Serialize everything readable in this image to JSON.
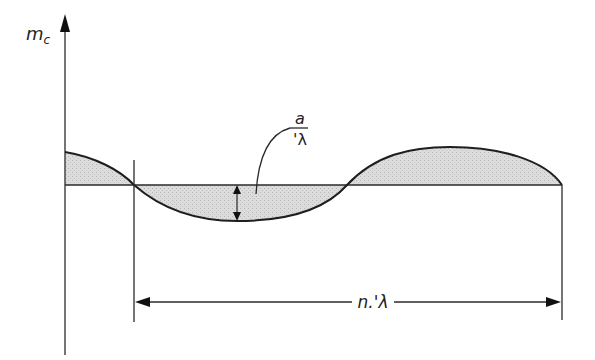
{
  "diagram": {
    "y_axis_label": "m",
    "y_axis_label_sub": "c",
    "amplitude_label_numerator": "a",
    "amplitude_label_denominator": "'λ",
    "wavelength_label": "n.'λ",
    "colors": {
      "line": "#2a2a2a",
      "fill": "#d8d8d8",
      "background": "#ffffff"
    },
    "elements": [
      "vertical m_c axis with arrow",
      "horizontal baseline",
      "wave curve with shaded area between curve and baseline",
      "amplitude double-arrow with leader to a/'λ label",
      "dimension line spanning n.'λ between two vertical extension lines"
    ]
  }
}
